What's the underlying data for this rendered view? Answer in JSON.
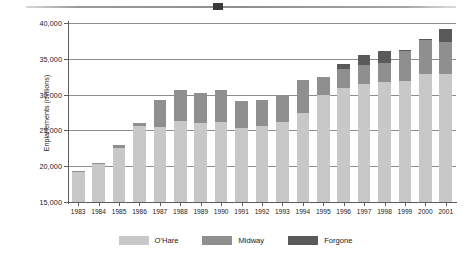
{
  "figure": {
    "top_rule": "horizontal-rule",
    "background": "#ffffff"
  },
  "colors": {
    "ohare": "#c8c8c8",
    "midway": "#8f8f8f",
    "forgone": "#5a5a5a",
    "axis": "#5d5d5d",
    "gridline": "#8d8d8d"
  },
  "legend": {
    "position": "bottom-center",
    "entries": [
      {
        "label": "O'Hare",
        "color": "#c8c8c8"
      },
      {
        "label": "Midway",
        "color": "#8f8f8f"
      },
      {
        "label": "Forgone",
        "color": "#5a5a5a"
      }
    ]
  },
  "chart_data": {
    "type": "bar",
    "stacked": true,
    "title": "",
    "xlabel": "",
    "ylabel": "Enplanements (millions)",
    "ylim": [
      15000,
      40000
    ],
    "yticks": [
      15000,
      20000,
      25000,
      30000,
      35000,
      40000
    ],
    "ytick_labels": [
      "15,000",
      "20,000",
      "25,000",
      "30,000",
      "35,000",
      "40,000"
    ],
    "grid": true,
    "grid_axis": "y",
    "legend_position": "bottom-center",
    "categories": [
      "1983",
      "1984",
      "1985",
      "1986",
      "1987",
      "1988",
      "1989",
      "1990",
      "1991",
      "1992",
      "1993",
      "1994",
      "1995",
      "1996",
      "1997",
      "1998",
      "1999",
      "2000",
      "2001"
    ],
    "series": [
      {
        "name": "O'Hare",
        "color": "#c8c8c8",
        "values": [
          18800,
          19800,
          22000,
          25000,
          21500,
          22200,
          21800,
          21900,
          21400,
          21700,
          22300,
          23500,
          27800,
          28400,
          28400,
          28700,
          28800,
          29600,
          29000
        ]
      },
      {
        "name": "Midway",
        "color": "#8f8f8f",
        "values": [
          500,
          600,
          900,
          1100,
          7700,
          8400,
          8400,
          8800,
          7700,
          7500,
          7700,
          8500,
          4700,
          4700,
          4600,
          4600,
          7200,
          8000,
          7300
        ]
      },
      {
        "name": "Forgone",
        "color": "#5a5a5a",
        "values": [
          0,
          0,
          0,
          0,
          0,
          0,
          0,
          0,
          0,
          0,
          0,
          0,
          0,
          1200,
          2600,
          2800,
          200,
          100,
          2900
        ]
      }
    ],
    "totals": [
      19300,
      20400,
      22900,
      26100,
      29200,
      30600,
      30200,
      30700,
      29100,
      29200,
      30000,
      32000,
      32500,
      34300,
      35600,
      36100,
      36200,
      37700,
      39200
    ]
  }
}
